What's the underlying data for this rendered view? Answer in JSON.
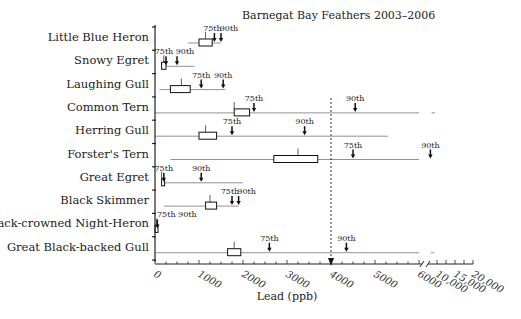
{
  "chart_data": {
    "type": "boxplot",
    "title": "Barnegat Bay Feathers 2003–2006",
    "xlabel": "Lead (ppb)",
    "ylabel": "",
    "x_ticks": [
      "0",
      "1000",
      "2000",
      "3000",
      "4000",
      "5000",
      "6000",
      "10,000",
      "15,000",
      "20,000"
    ],
    "x_break": "6000 to 10,000 (broken axis)",
    "reference_line": {
      "x": 4000,
      "style": "dotted vertical with arrow"
    },
    "percentile_labels": [
      "75th",
      "90th"
    ],
    "series": [
      {
        "name": "Little Blue Heron",
        "range": [
          750,
          1500
        ],
        "box": [
          1000,
          1300
        ],
        "median_mark": 1150,
        "p75": 1350,
        "p90": 1500
      },
      {
        "name": "Snowy Egret",
        "range": [
          150,
          900
        ],
        "box": [
          150,
          250
        ],
        "median_mark": 200,
        "p75": 250,
        "p90": 500
      },
      {
        "name": "Laughing Gull",
        "range": [
          100,
          1600
        ],
        "box": [
          350,
          800
        ],
        "median_mark": 600,
        "p75": 1050,
        "p90": 1550
      },
      {
        "name": "Common Tern",
        "range": [
          0,
          6000
        ],
        "range_extended": [
          6600,
          7500
        ],
        "box": [
          1800,
          2150
        ],
        "median_mark": 1800,
        "p75": 2250,
        "p90": 4550
      },
      {
        "name": "Herring Gull",
        "range": [
          0,
          5300
        ],
        "box": [
          1000,
          1400
        ],
        "median_mark": 1150,
        "p75": 1750,
        "p90": 3400
      },
      {
        "name": "Forster's Tern",
        "range": [
          350,
          6000
        ],
        "box": [
          2700,
          3700
        ],
        "median_mark": 3250,
        "p75": 4500,
        "p90": 6350
      },
      {
        "name": "Great Egret",
        "range": [
          150,
          2000
        ],
        "box": [
          150,
          200
        ],
        "median_mark": 150,
        "p75": 200,
        "p90": 1050
      },
      {
        "name": "Black Skimmer",
        "range": [
          200,
          1900
        ],
        "box": [
          1150,
          1400
        ],
        "median_mark": 1250,
        "p75": 1750,
        "p90": 1900
      },
      {
        "name": "Black-crowned Night-Heron",
        "range": [
          0,
          50
        ],
        "box": [
          0,
          50
        ],
        "median_mark": 30,
        "p75": 30,
        "p90": 40
      },
      {
        "name": "Great Black-backed Gull",
        "range": [
          0,
          6000
        ],
        "range_extended": [
          6500,
          7300
        ],
        "box": [
          1650,
          1950
        ],
        "median_mark": 1800,
        "p75": 2600,
        "p90": 4350
      }
    ]
  }
}
